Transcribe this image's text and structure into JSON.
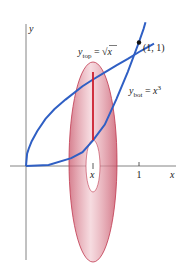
{
  "diagram": {
    "type": "washer-method-solid-of-revolution",
    "curves": [
      {
        "name": "top",
        "label_var": "y",
        "label_sub": "top",
        "label_eq": " = ",
        "label_expr": "√x",
        "color": "#2f5fc4"
      },
      {
        "name": "bottom",
        "label_var": "y",
        "label_sub": "bot",
        "label_eq": " = ",
        "label_expr_base": "x",
        "label_expr_exp": "3",
        "color": "#2f5fc4"
      }
    ],
    "intersection_point": {
      "label": "(1, 1)"
    },
    "axes": {
      "x_label": "x",
      "y_label": "y"
    },
    "ticks": {
      "x_sample": "x",
      "one": "1"
    },
    "colors": {
      "curve": "#2f5fc4",
      "washer_fill": "#e6a8b4",
      "washer_edge": "#c0394f",
      "slice_line": "#cc1f2e",
      "axis": "#777777"
    }
  }
}
